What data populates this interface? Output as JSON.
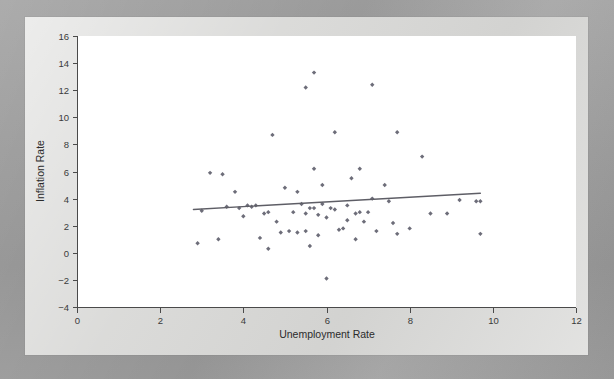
{
  "figure": {
    "background_color": "#9b9b9b",
    "panel_color": "#d6d6d4",
    "plot_area_color": "#ffffff",
    "marker_color": "#6d6d79",
    "trend_line_color": "#5e5e66"
  },
  "chart_data": {
    "type": "scatter",
    "title": "",
    "xlabel": "Unemployment Rate",
    "ylabel": "Inflation Rate",
    "xlim": [
      0,
      12
    ],
    "ylim": [
      -4,
      16
    ],
    "xticks": [
      0,
      2,
      4,
      6,
      8,
      10,
      12
    ],
    "yticks": [
      -4,
      -2,
      0,
      2,
      4,
      6,
      8,
      10,
      12,
      14,
      16
    ],
    "xtick_labels": [
      "0",
      "2",
      "4",
      "6",
      "8",
      "10",
      "12"
    ],
    "ytick_labels": [
      "-4",
      "-2",
      "0",
      "2",
      "4",
      "6",
      "8",
      "10",
      "12",
      "14",
      "16"
    ],
    "grid": false,
    "legend": null,
    "trend_line": {
      "type": "linear-fit",
      "x_start": 2.8,
      "y_start": 3.2,
      "x_end": 9.7,
      "y_end": 4.4,
      "slope": 0.174,
      "intercept": 2.713
    },
    "points": [
      [
        2.9,
        0.7
      ],
      [
        3.0,
        3.1
      ],
      [
        3.2,
        5.9
      ],
      [
        3.4,
        1.0
      ],
      [
        3.5,
        5.8
      ],
      [
        3.6,
        3.4
      ],
      [
        3.8,
        4.5
      ],
      [
        3.9,
        3.3
      ],
      [
        4.0,
        2.7
      ],
      [
        4.1,
        3.5
      ],
      [
        4.2,
        3.4
      ],
      [
        4.3,
        3.5
      ],
      [
        4.4,
        1.1
      ],
      [
        4.5,
        2.9
      ],
      [
        4.6,
        3.0
      ],
      [
        4.6,
        0.3
      ],
      [
        4.7,
        8.7
      ],
      [
        4.8,
        2.3
      ],
      [
        4.9,
        1.5
      ],
      [
        5.0,
        4.8
      ],
      [
        5.1,
        1.6
      ],
      [
        5.2,
        3.0
      ],
      [
        5.3,
        4.5
      ],
      [
        5.3,
        1.5
      ],
      [
        5.4,
        3.6
      ],
      [
        5.5,
        12.2
      ],
      [
        5.5,
        2.9
      ],
      [
        5.5,
        1.6
      ],
      [
        5.6,
        3.3
      ],
      [
        5.6,
        0.5
      ],
      [
        5.7,
        13.3
      ],
      [
        5.7,
        6.2
      ],
      [
        5.7,
        3.3
      ],
      [
        5.8,
        2.8
      ],
      [
        5.8,
        1.3
      ],
      [
        5.9,
        5.0
      ],
      [
        5.9,
        3.6
      ],
      [
        6.0,
        2.6
      ],
      [
        6.0,
        -1.9
      ],
      [
        6.1,
        3.3
      ],
      [
        6.2,
        8.9
      ],
      [
        6.2,
        3.2
      ],
      [
        6.3,
        1.7
      ],
      [
        6.4,
        1.8
      ],
      [
        6.5,
        3.5
      ],
      [
        6.5,
        2.4
      ],
      [
        6.6,
        5.5
      ],
      [
        6.7,
        2.9
      ],
      [
        6.7,
        1.0
      ],
      [
        6.8,
        6.2
      ],
      [
        6.8,
        3.0
      ],
      [
        6.9,
        2.3
      ],
      [
        7.0,
        3.0
      ],
      [
        7.1,
        12.4
      ],
      [
        7.1,
        4.0
      ],
      [
        7.2,
        1.6
      ],
      [
        7.4,
        5.0
      ],
      [
        7.5,
        3.8
      ],
      [
        7.6,
        2.2
      ],
      [
        7.7,
        8.9
      ],
      [
        7.7,
        1.4
      ],
      [
        8.0,
        1.8
      ],
      [
        8.3,
        7.1
      ],
      [
        8.5,
        2.9
      ],
      [
        8.9,
        2.9
      ],
      [
        9.2,
        3.9
      ],
      [
        9.6,
        3.8
      ],
      [
        9.7,
        3.8
      ],
      [
        9.7,
        1.4
      ]
    ]
  },
  "geometry": {
    "plot_left_px": 77,
    "plot_right_px": 576,
    "plot_top_px": 36,
    "plot_bottom_px": 307
  }
}
